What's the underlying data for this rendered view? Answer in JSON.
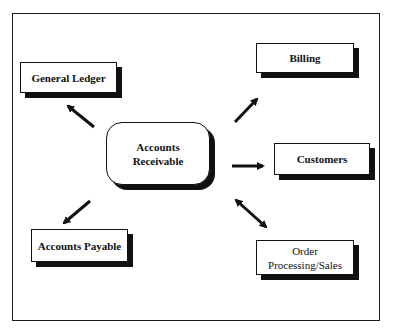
{
  "diagram": {
    "center": {
      "label_line1": "Accounts",
      "label_line2": "Receivable"
    },
    "nodes": [
      {
        "id": "general-ledger",
        "label": "General Ledger"
      },
      {
        "id": "billing",
        "label": "Billing"
      },
      {
        "id": "customers",
        "label": "Customers"
      },
      {
        "id": "accounts-payable",
        "label": "Accounts Payable"
      },
      {
        "id": "order-processing",
        "label_line1": "Order",
        "label_line2": "Processing/Sales"
      }
    ],
    "edges": [
      {
        "from": "Accounts Receivable",
        "to": "General Ledger",
        "direction": "one-way"
      },
      {
        "from": "Accounts Receivable",
        "to": "Billing",
        "direction": "one-way"
      },
      {
        "from": "Accounts Receivable",
        "to": "Customers",
        "direction": "one-way"
      },
      {
        "from": "Accounts Receivable",
        "to": "Accounts Payable",
        "direction": "one-way"
      },
      {
        "from": "Accounts Receivable",
        "to": "Order Processing/Sales",
        "direction": "two-way"
      }
    ],
    "colors": {
      "stroke": "#111111",
      "background": "#ffffff"
    }
  }
}
